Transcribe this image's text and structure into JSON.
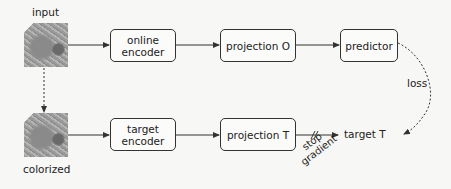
{
  "diagram": {
    "top_row": {
      "image_label": "input",
      "boxes": [
        {
          "id": "online-encoder",
          "line1": "online",
          "line2": "encoder"
        },
        {
          "id": "projection-o",
          "label": "projection O"
        },
        {
          "id": "predictor",
          "label": "predictor"
        }
      ]
    },
    "bottom_row": {
      "image_label": "colorized",
      "boxes": [
        {
          "id": "target-encoder",
          "line1": "target",
          "line2": "encoder"
        },
        {
          "id": "projection-t",
          "label": "projection T"
        }
      ],
      "output_label": "target T"
    },
    "annotations": {
      "loss": "loss",
      "stop_gradient_line1": "stop",
      "stop_gradient_line2": "gradient"
    },
    "colors": {
      "line": "#333333",
      "background": "#f7f7f5"
    }
  }
}
